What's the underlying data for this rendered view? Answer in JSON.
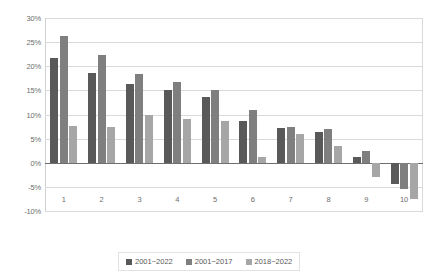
{
  "chart_data": {
    "type": "bar",
    "title": "",
    "subtitle": "",
    "xlabel": "",
    "ylabel": "",
    "categories": [
      "1",
      "2",
      "3",
      "4",
      "5",
      "6",
      "7",
      "8",
      "9",
      "10"
    ],
    "series": [
      {
        "name": "2001~2022",
        "color": "#595959",
        "values": [
          21.7,
          18.7,
          16.4,
          15.0,
          13.7,
          8.6,
          7.3,
          6.4,
          1.2,
          -4.5
        ]
      },
      {
        "name": "2001~2017",
        "color": "#7f7f7f",
        "values": [
          26.3,
          22.3,
          18.4,
          16.7,
          15.1,
          11.0,
          7.4,
          7.0,
          2.4,
          -5.5
        ]
      },
      {
        "name": "2018~2022",
        "color": "#a6a6a6",
        "values": [
          7.6,
          7.4,
          9.9,
          9.1,
          8.6,
          1.1,
          6.0,
          3.4,
          -3.0,
          -7.5
        ]
      }
    ],
    "ylim": [
      -10,
      30
    ],
    "ystep": 5,
    "yticks": [
      "30%",
      "25%",
      "20%",
      "15%",
      "10%",
      "5%",
      "0%",
      "-5%",
      "-10%"
    ],
    "ytick_values": [
      30,
      25,
      20,
      15,
      10,
      5,
      0,
      -5,
      -10
    ],
    "grid": "horizontal",
    "legend_position": "bottom"
  },
  "legend": {
    "items": [
      {
        "label": "2001~2022",
        "color": "#595959"
      },
      {
        "label": "2001~2017",
        "color": "#7f7f7f"
      },
      {
        "label": "2018~2022",
        "color": "#a6a6a6"
      }
    ]
  }
}
